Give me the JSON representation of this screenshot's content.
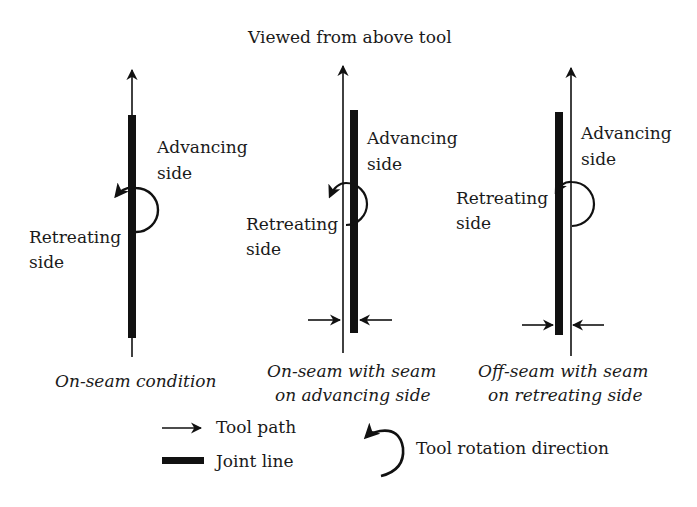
{
  "title": "Viewed from above tool",
  "colors": {
    "ink": "#111111",
    "text": "#1a1a1a",
    "background": "#ffffff"
  },
  "panels": [
    {
      "id": "on-seam",
      "advancing_label": [
        "Advancing",
        "side"
      ],
      "retreating_label": [
        "Retreating",
        "side"
      ],
      "caption": [
        "On-seam condition"
      ]
    },
    {
      "id": "on-seam-advancing",
      "advancing_label": [
        "Advancing",
        "side"
      ],
      "retreating_label": [
        "Retreating",
        "side"
      ],
      "caption": [
        "On-seam with seam",
        "on advancing side"
      ]
    },
    {
      "id": "off-seam-retreating",
      "advancing_label": [
        "Advancing",
        "side"
      ],
      "retreating_label": [
        "Retreating",
        "side"
      ],
      "caption": [
        "Off-seam with seam",
        "on retreating side"
      ]
    }
  ],
  "legend": {
    "tool_path": {
      "icon": "arrow-right-icon",
      "label": "Tool path"
    },
    "joint_line": {
      "icon": "thick-bar-icon",
      "label": "Joint line"
    },
    "rotation": {
      "icon": "counterclockwise-arrow-icon",
      "label": "Tool rotation direction"
    }
  }
}
